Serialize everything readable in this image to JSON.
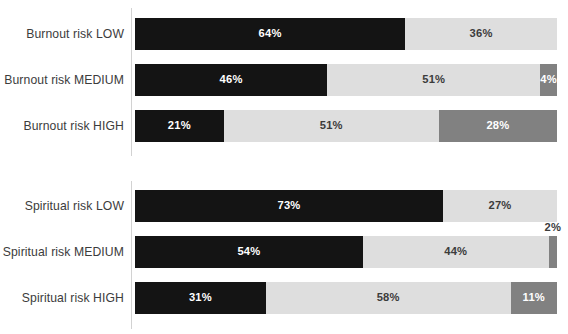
{
  "chart_data": {
    "type": "bar",
    "subtype": "stacked-horizontal-100-percent",
    "title": "",
    "xlabel": "",
    "ylabel": "",
    "grid": false,
    "legend": "none",
    "xlim": [
      0,
      100
    ],
    "series": [
      {
        "name": "black-segment",
        "color": "#141414"
      },
      {
        "name": "light-gray-segment",
        "color": "#dedede"
      },
      {
        "name": "dark-gray-segment",
        "color": "#818181"
      }
    ],
    "groups": [
      {
        "id": "burnout",
        "categories": [
          "Burnout risk LOW",
          "Burnout risk MEDIUM",
          "Burnout risk HIGH"
        ],
        "rows": [
          {
            "label": "Burnout risk LOW",
            "segments": [
              {
                "value": 64,
                "text": "64%",
                "color": "#141414",
                "style": "black",
                "label_position": "inside"
              },
              {
                "value": 36,
                "text": "36%",
                "color": "#dedede",
                "style": "light",
                "label_position": "inside"
              }
            ]
          },
          {
            "label": "Burnout risk MEDIUM",
            "segments": [
              {
                "value": 46,
                "text": "46%",
                "color": "#141414",
                "style": "black",
                "label_position": "inside"
              },
              {
                "value": 51,
                "text": "51%",
                "color": "#dedede",
                "style": "light",
                "label_position": "inside"
              },
              {
                "value": 4,
                "text": "4%",
                "color": "#818181",
                "style": "dark",
                "label_position": "inside"
              }
            ]
          },
          {
            "label": "Burnout risk HIGH",
            "segments": [
              {
                "value": 21,
                "text": "21%",
                "color": "#141414",
                "style": "black",
                "label_position": "inside"
              },
              {
                "value": 51,
                "text": "51%",
                "color": "#dedede",
                "style": "light",
                "label_position": "inside"
              },
              {
                "value": 28,
                "text": "28%",
                "color": "#818181",
                "style": "dark",
                "label_position": "inside"
              }
            ]
          }
        ]
      },
      {
        "id": "spiritual",
        "categories": [
          "Spiritual risk LOW",
          "Spiritual risk MEDIUM",
          "Spiritual risk HIGH"
        ],
        "rows": [
          {
            "label": "Spiritual risk LOW",
            "segments": [
              {
                "value": 73,
                "text": "73%",
                "color": "#141414",
                "style": "black",
                "label_position": "inside"
              },
              {
                "value": 27,
                "text": "27%",
                "color": "#dedede",
                "style": "light",
                "label_position": "inside"
              }
            ]
          },
          {
            "label": "Spiritual risk MEDIUM",
            "segments": [
              {
                "value": 54,
                "text": "54%",
                "color": "#141414",
                "style": "black",
                "label_position": "inside"
              },
              {
                "value": 44,
                "text": "44%",
                "color": "#dedede",
                "style": "light",
                "label_position": "inside"
              },
              {
                "value": 2,
                "text": "2%",
                "color": "#818181",
                "style": "dark",
                "label_position": "outside"
              }
            ]
          },
          {
            "label": "Spiritual risk HIGH",
            "segments": [
              {
                "value": 31,
                "text": "31%",
                "color": "#141414",
                "style": "black",
                "label_position": "inside"
              },
              {
                "value": 58,
                "text": "58%",
                "color": "#dedede",
                "style": "light",
                "label_position": "inside"
              },
              {
                "value": 11,
                "text": "11%",
                "color": "#818181",
                "style": "dark",
                "label_position": "inside"
              }
            ]
          }
        ]
      }
    ]
  }
}
